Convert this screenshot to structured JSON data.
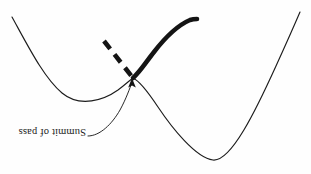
{
  "figure": {
    "title": "Summit of pass",
    "orientation_degrees": 180,
    "background_color": "#fefefe",
    "stroke_color": "#1c1c1c",
    "thick_stroke_color": "#141414",
    "annotations": [
      {
        "id": "summit-label",
        "text": "Summit of pass",
        "rotation_degrees": 180,
        "leader": "curved line from label to arrowhead",
        "points_to": "saddle point of the thin curve"
      }
    ],
    "curves": [
      {
        "id": "terrain-profile",
        "style": "thin-solid",
        "description": "continuous terrain profile with a left trough, a central summit (saddle), and a deep right trough",
        "path": "M 12 17 C 28 46 44 78 62 93 C 80 108 104 100 118 90 C 126 84 130 80 133 78 C 140 81 148 92 158 107 C 172 128 196 158 213 160 C 231 162 256 110 276 66 C 286 44 294 26 300 12"
      },
      {
        "id": "reaction-path-solid",
        "style": "thick-solid",
        "description": "heavy solid path ascending to the right from the summit",
        "path": "M 133 78 C 140 72 146 62 154 52 C 164 39 176 26 190 20 C 193 19 195 19 197 19"
      },
      {
        "id": "reaction-path-dashed",
        "style": "thick-dashed",
        "description": "heavy dashed path descending from upper-left into the summit",
        "path": "M 104 41 L 133 78"
      }
    ],
    "arrow": {
      "id": "summit-arrow",
      "tip_x": 132,
      "tip_y": 79,
      "direction": "up",
      "leader_path": "M 88 136 C 100 136 112 124 120 110 C 126 99 130 88 132 82"
    }
  }
}
